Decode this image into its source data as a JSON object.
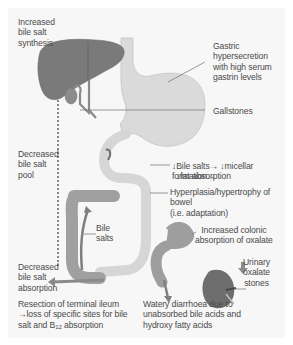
{
  "diagram": {
    "colors": {
      "background": "#f7f7f7",
      "liver": "#7a7a7a",
      "bowel_light": "#d8d8d8",
      "bowel_dark": "#9a9a9a",
      "kidney": "#6e6e6e",
      "text": "#4a4a4a",
      "leader_line": "#6a6a6a"
    },
    "labels": {
      "increased_synthesis": "Increased\nbile salt\nsynthesis",
      "gastric": "Gastric\nhypersecretion\nwith high serum\ngastrin levels",
      "gallstones": "Gallstones",
      "decreased_pool": "Decreased\nbile salt\npool",
      "bile_salts_effect_line1": "↓Bile salts→ ↓micellar formation→",
      "bile_salts_effect_line2": "↓fat absorption",
      "hyperplasia": "Hyperplasia/hypertrophy of bowel\n(i.e. adaptation)",
      "bile_salts": "Bile\nsalts",
      "colonic_oxalate": "Increased colonic\nabsorption of oxalate",
      "urinary_stones": "Urinary\noxalate\nstones",
      "decreased_absorption": "Decreased\nbile salt\nabsorption",
      "resection_prefix": "Resection of terminal ileum\n→loss of specific sites for bile\nsalt and B",
      "resection_sub": "12",
      "resection_suffix": " absorption",
      "diarrhoea": "Watery diarrhoea due to\nunabsorbed bile acids and\nhydroxy fatty acids"
    }
  }
}
